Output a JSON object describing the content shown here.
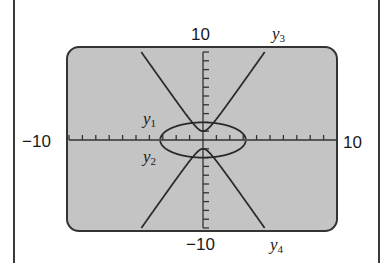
{
  "chart_data": {
    "type": "line",
    "title": "",
    "xlabel": "",
    "ylabel": "",
    "xlim": [
      -10,
      10
    ],
    "ylim": [
      -10,
      10
    ],
    "xscale": 1,
    "yscale": 1,
    "grid": false,
    "tick_labels": {
      "xmin": "−10",
      "xmax": "10",
      "ymin": "−10",
      "ymax": "10"
    },
    "series": [
      {
        "name": "y1",
        "label": "y",
        "sub": "1",
        "description": "upper half of ellipse",
        "equation": "y = 2*sqrt(1 - x^2/10.2)"
      },
      {
        "name": "y2",
        "label": "y",
        "sub": "2",
        "description": "lower half of ellipse",
        "equation": "y = -2*sqrt(1 - x^2/10.2)"
      },
      {
        "name": "y3",
        "label": "y",
        "sub": "3",
        "description": "upper branch of hyperbola",
        "equation": "y = sqrt(1 + 4.67*x^2)"
      },
      {
        "name": "y4",
        "label": "y",
        "sub": "4",
        "description": "lower branch of hyperbola",
        "equation": "y = -sqrt(1 + 4.67*x^2)"
      }
    ]
  },
  "screen": {
    "background": "#c4c4c4",
    "border": "#333333",
    "curve_color": "#2a2a2a"
  }
}
